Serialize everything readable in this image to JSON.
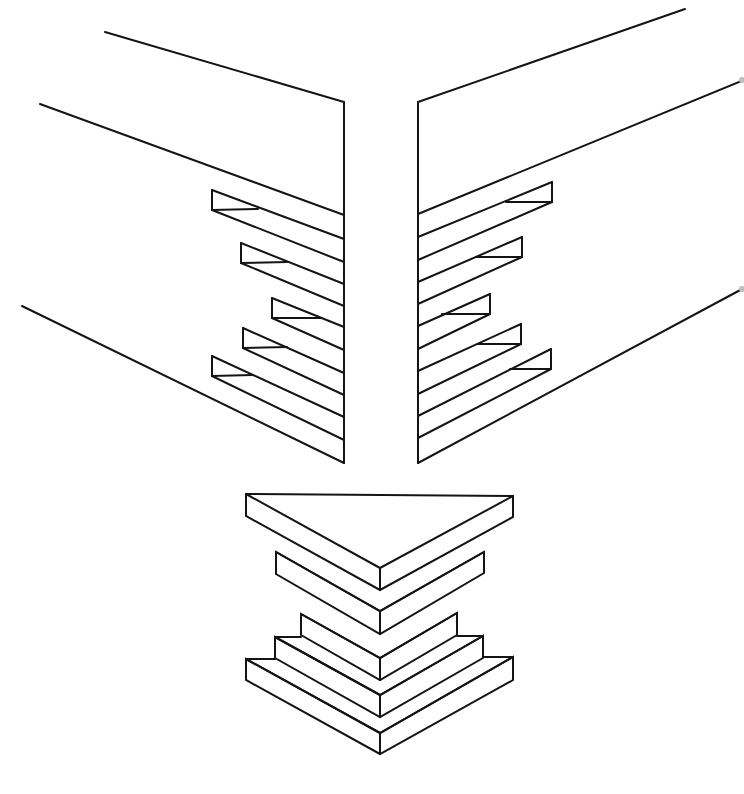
{
  "figure": {
    "line_color": "#141414",
    "background": "#ffffff",
    "parts": [
      {
        "id": "left-board",
        "label": "Left board with tapered slots",
        "slot_count": 5
      },
      {
        "id": "right-board",
        "label": "Right board with tapered slots",
        "slot_count": 5
      },
      {
        "id": "stacked-fingers",
        "label": "Stacked mitred finger pieces",
        "layer_count": 5
      }
    ]
  },
  "geometry": {
    "left_board": {
      "edge_x": 344,
      "edge_top": 102,
      "edge_bottom": 463,
      "top_line": [
        [
          105,
          32
        ],
        [
          344,
          102
        ]
      ],
      "mid_line": [
        [
          40,
          104
        ],
        [
          344,
          215
        ]
      ],
      "bottom_line": [
        [
          22,
          306
        ],
        [
          344,
          463
        ]
      ],
      "slots": [
        {
          "x": 212,
          "y": 190
        },
        {
          "x": 241,
          "y": 243
        },
        {
          "x": 272,
          "y": 298
        },
        {
          "x": 243,
          "y": 328
        },
        {
          "x": 212,
          "y": 356
        }
      ]
    },
    "right_board": {
      "edge_x": 418,
      "edge_top": 102,
      "edge_bottom": 463,
      "top_line": [
        [
          418,
          102
        ],
        [
          685,
          9
        ]
      ],
      "mid_line": [
        [
          418,
          214
        ],
        [
          744,
          80
        ]
      ],
      "bottom_line": [
        [
          418,
          463
        ],
        [
          744,
          288
        ]
      ],
      "slots": [
        {
          "x": 552,
          "y": 182
        },
        {
          "x": 522,
          "y": 237
        },
        {
          "x": 490,
          "y": 294
        },
        {
          "x": 521,
          "y": 324
        },
        {
          "x": 551,
          "y": 349
        }
      ]
    },
    "stack": {
      "apex_x": 380,
      "layers": [
        {
          "left": 246,
          "right": 513,
          "top": 493,
          "apex": 568,
          "thick": 22
        },
        {
          "left": 276,
          "right": 484,
          "top": 552,
          "apex": 611,
          "thick": 22
        },
        {
          "left": 301,
          "right": 457,
          "top": 613,
          "apex": 658,
          "thick": 22
        },
        {
          "left": 275,
          "right": 483,
          "top": 635,
          "apex": 695,
          "thick": 22
        },
        {
          "left": 246,
          "right": 513,
          "top": 657,
          "apex": 753,
          "thick": 22
        }
      ]
    }
  }
}
